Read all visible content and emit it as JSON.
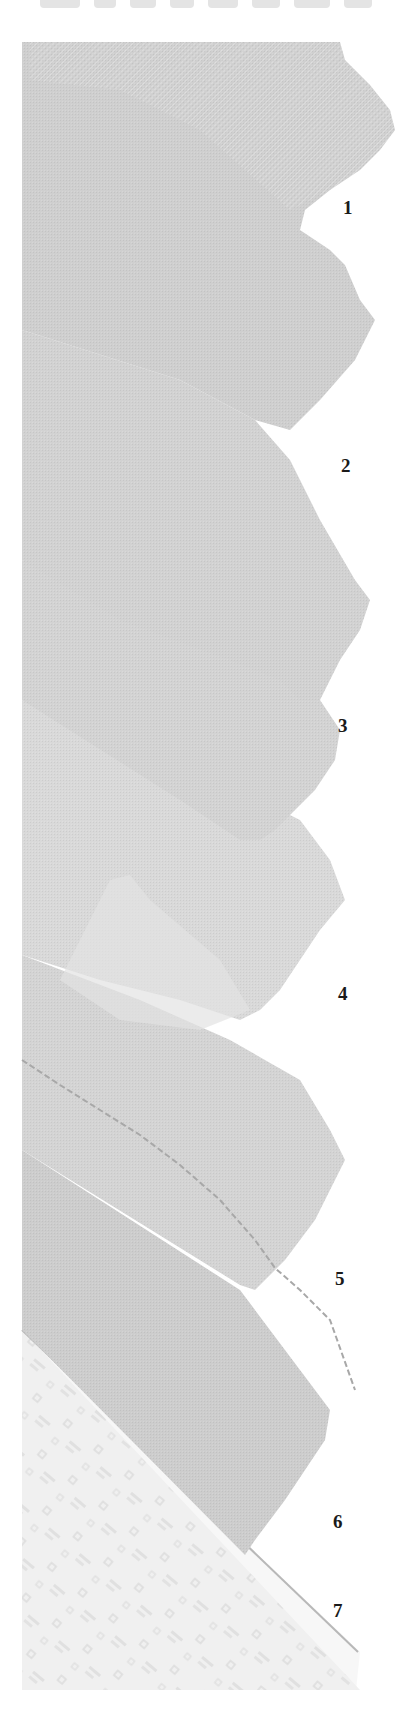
{
  "page": {
    "heading_visible": "cropped (illegible top edge of large heading text)"
  },
  "swatches": [
    {
      "number": "1",
      "label_x": 343,
      "label_y": 197,
      "tone": "#cfcfcf"
    },
    {
      "number": "2",
      "label_x": 341,
      "label_y": 455,
      "tone": "#d2d2d2"
    },
    {
      "number": "3",
      "label_x": 338,
      "label_y": 715,
      "tone": "#d6d6d6"
    },
    {
      "number": "4",
      "label_x": 338,
      "label_y": 983,
      "tone": "#d9d9d9"
    },
    {
      "number": "5",
      "label_x": 335,
      "label_y": 1268,
      "tone": "#d3d3d3"
    },
    {
      "number": "6",
      "label_x": 333,
      "label_y": 1511,
      "tone": "#cbcbcb"
    },
    {
      "number": "7",
      "label_x": 333,
      "label_y": 1600,
      "tone": "#ececec"
    }
  ]
}
